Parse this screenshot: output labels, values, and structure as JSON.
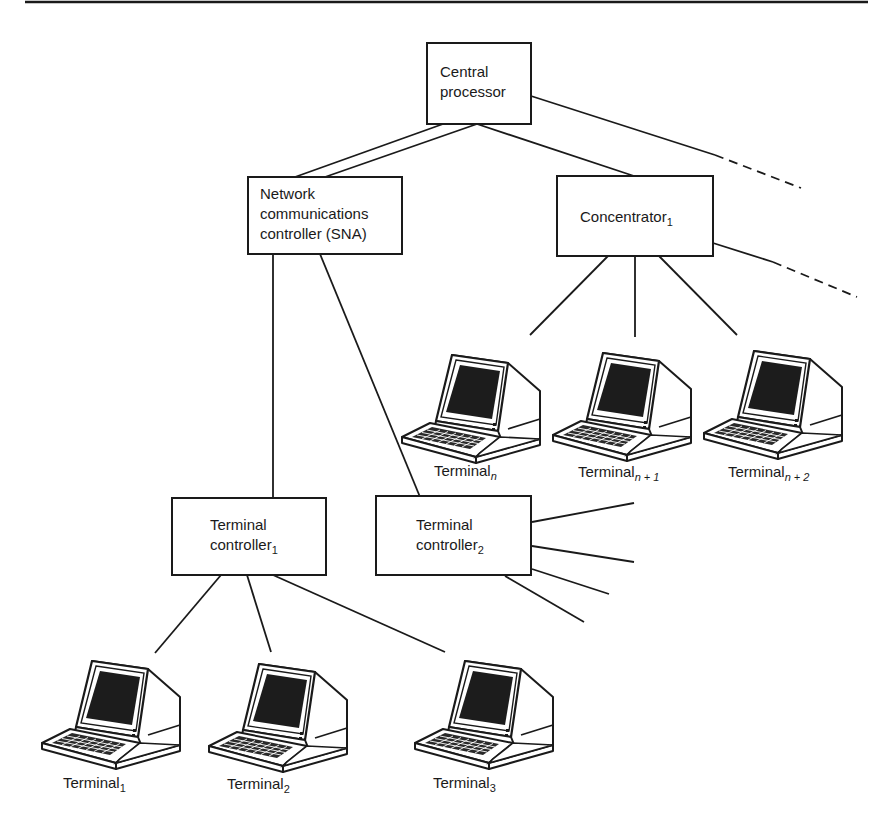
{
  "nodes": {
    "central_processor": {
      "lines": [
        "Central",
        "processor"
      ]
    },
    "ncc": {
      "lines": [
        "Network",
        "communications",
        "controller (SNA)"
      ]
    },
    "concentrator": {
      "label": "Concentrator",
      "sub": "1"
    },
    "tc1": {
      "line1": "Terminal",
      "line2": "controller",
      "sub": "1"
    },
    "tc2": {
      "line1": "Terminal",
      "line2": "controller",
      "sub": "2"
    }
  },
  "terminals": [
    {
      "label": "Terminal",
      "sub": "n",
      "sub_italic": true
    },
    {
      "label": "Terminal",
      "sub": "n + 1",
      "sub_italic": true
    },
    {
      "label": "Terminal",
      "sub": "n + 2",
      "sub_italic": true
    },
    {
      "label": "Terminal",
      "sub": "1",
      "sub_italic": false
    },
    {
      "label": "Terminal",
      "sub": "2",
      "sub_italic": false
    },
    {
      "label": "Terminal",
      "sub": "3",
      "sub_italic": false
    }
  ],
  "colors": {
    "ink": "#1a1a1a",
    "screen": "#1c1c1c",
    "paper": "#ffffff"
  }
}
